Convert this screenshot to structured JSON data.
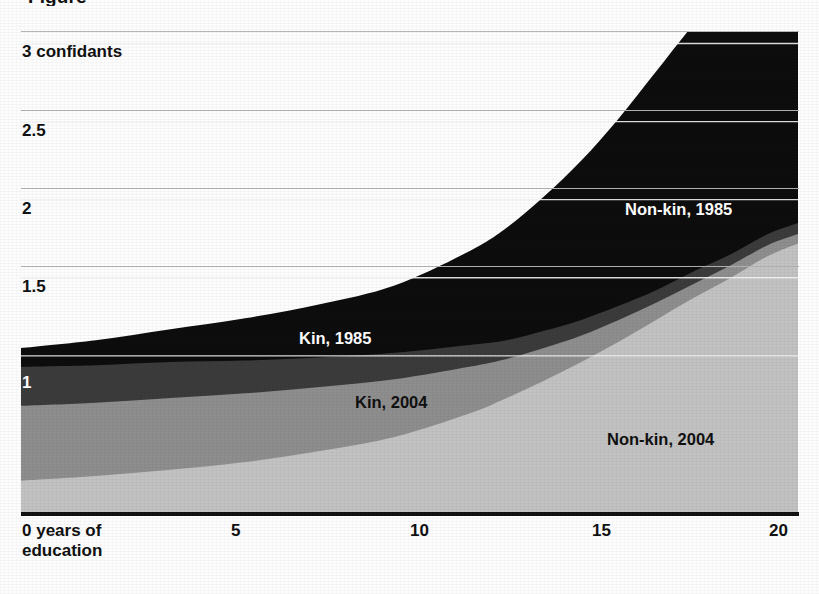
{
  "figure": {
    "title_fragment": "Figure",
    "background": "#fdfdfd"
  },
  "axes": {
    "y": {
      "label_top": "3 confidants",
      "ticks": [
        {
          "value": 3,
          "label": "3 confidants",
          "on_dark": false
        },
        {
          "value": 2.5,
          "label": "2.5",
          "on_dark": false
        },
        {
          "value": 2,
          "label": "2",
          "on_dark": false
        },
        {
          "value": 1.5,
          "label": "1.5",
          "on_dark": false
        },
        {
          "value": 1,
          "label": "1",
          "on_dark": true
        }
      ],
      "range": [
        0,
        3.08
      ],
      "gridlines": true,
      "gridline_color": "#b4b4b4",
      "gridline_color_on_fill": "#f2f2f2"
    },
    "x": {
      "ticks": [
        {
          "value": 0,
          "label": "0 years of"
        },
        {
          "value": 5,
          "label": "5"
        },
        {
          "value": 10,
          "label": "10"
        },
        {
          "value": 15,
          "label": "15"
        },
        {
          "value": 20,
          "label": "20"
        }
      ],
      "label_second_line": "education",
      "range": [
        0,
        20.8
      ],
      "axis_line_color": "#121212"
    }
  },
  "annotations": [
    {
      "text": "Non-kin, 1985",
      "tone": "light",
      "left": 625,
      "top": 201
    },
    {
      "text": "Kin, 1985",
      "tone": "light",
      "left": 299,
      "top": 330
    },
    {
      "text": "Kin, 2004",
      "tone": "dark",
      "left": 355,
      "top": 394
    },
    {
      "text": "Non-kin, 2004",
      "tone": "dark",
      "left": 607,
      "top": 431
    }
  ],
  "chart_data": {
    "type": "area",
    "stacked": true,
    "xlabel": "years of education",
    "ylabel": "confidants",
    "xlim": [
      0,
      20.8
    ],
    "ylim": [
      0,
      3.08
    ],
    "grid": true,
    "legend_position": "inline-annotations",
    "x": [
      0,
      2,
      4,
      6,
      8,
      10,
      12,
      13,
      14,
      15,
      16,
      17,
      18,
      19,
      20,
      20.8
    ],
    "series": [
      {
        "name": "Non-kin, 2004",
        "color": "#c2c2c2",
        "order": 1,
        "values": [
          0.2,
          0.23,
          0.27,
          0.32,
          0.39,
          0.48,
          0.63,
          0.73,
          0.84,
          0.96,
          1.09,
          1.23,
          1.37,
          1.5,
          1.64,
          1.72
        ]
      },
      {
        "name": "Kin, 2004",
        "color": "#8e8e8e",
        "order": 2,
        "values": [
          0.48,
          0.47,
          0.46,
          0.44,
          0.41,
          0.37,
          0.3,
          0.25,
          0.21,
          0.17,
          0.14,
          0.11,
          0.09,
          0.08,
          0.07,
          0.06
        ]
      },
      {
        "name": "Kin, 1985",
        "color": "#3b3b3b",
        "order": 3,
        "values": [
          0.25,
          0.24,
          0.23,
          0.21,
          0.19,
          0.17,
          0.14,
          0.12,
          0.11,
          0.1,
          0.09,
          0.08,
          0.08,
          0.07,
          0.07,
          0.07
        ]
      },
      {
        "name": "Non-kin, 1985",
        "color": "#0d0d0d",
        "order": 4,
        "values": [
          0.12,
          0.16,
          0.21,
          0.27,
          0.34,
          0.43,
          0.6,
          0.72,
          0.86,
          1.02,
          1.2,
          1.4,
          1.58,
          1.72,
          1.83,
          1.88
        ]
      }
    ],
    "series_totals": {
      "note": "cumulative stack top at each x",
      "values": [
        1.05,
        1.1,
        1.17,
        1.24,
        1.33,
        1.45,
        1.67,
        1.82,
        2.02,
        2.25,
        2.52,
        2.82,
        3.12,
        3.37,
        3.61,
        3.73
      ]
    }
  }
}
